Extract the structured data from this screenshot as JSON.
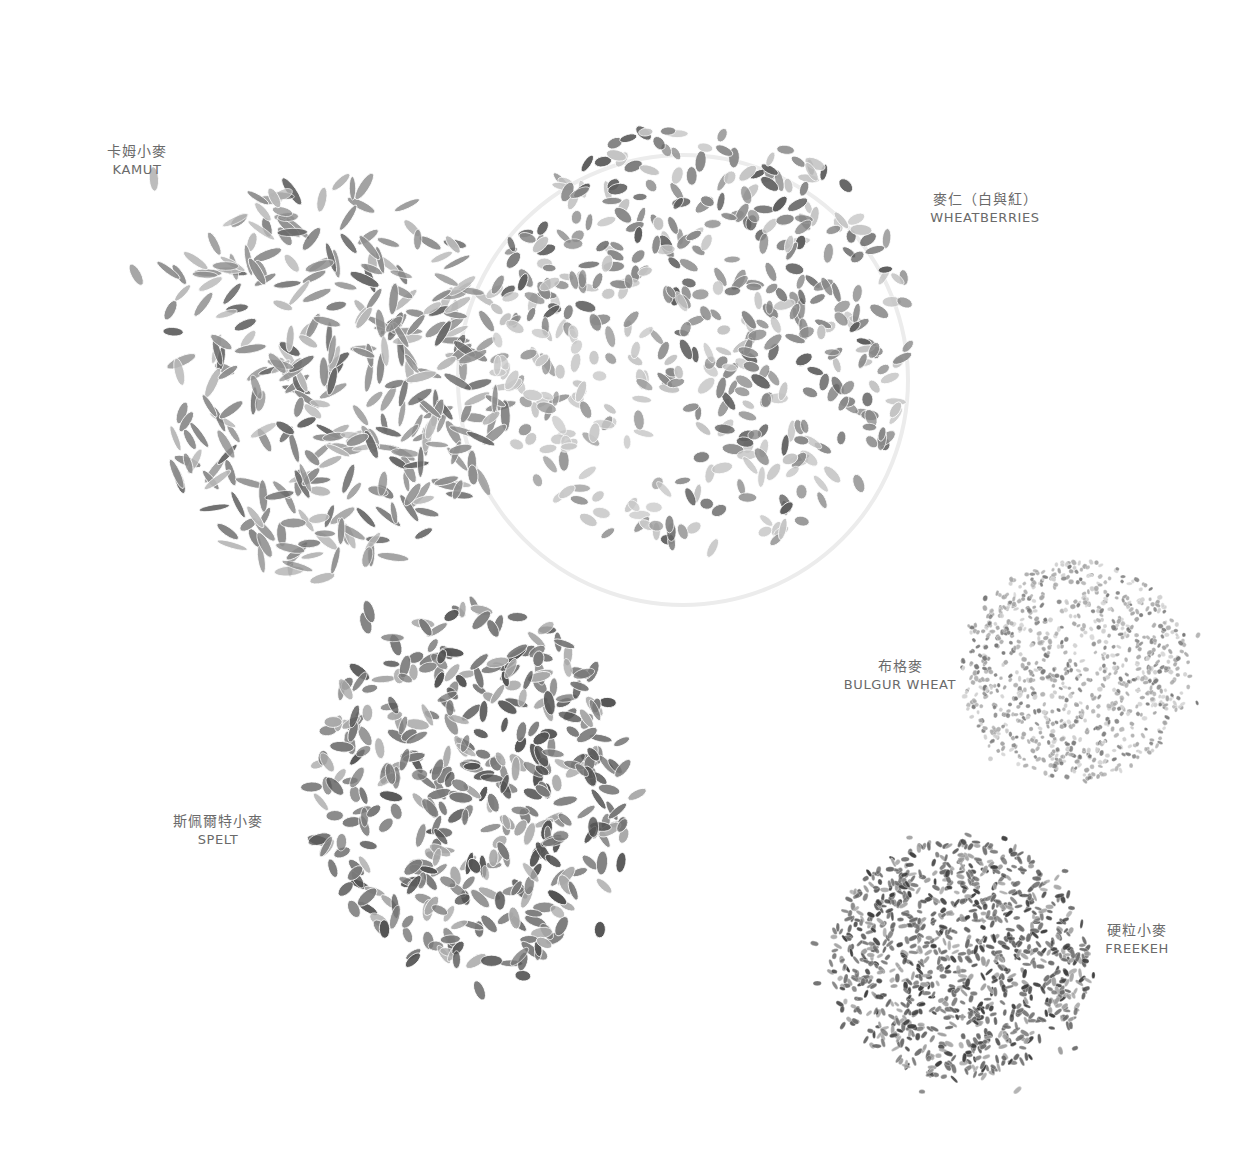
{
  "image": {
    "subject": "Overhead photo of wheat grain varieties on white background, grayscale",
    "background": "#ffffff"
  },
  "grains": [
    {
      "id": "kamut",
      "label_zh": "卡姆小麥",
      "label_en": "KAMUT",
      "pile": {
        "cx": 330,
        "cy": 380,
        "rx": 175,
        "ry": 200,
        "count": 360,
        "scatter": 70,
        "len": 26,
        "wid": 8,
        "tone": "#8f8f8f",
        "shade": "#6a6a6a",
        "light": "#b8b8b8"
      }
    },
    {
      "id": "wheatberries",
      "label_zh": "麥仁（白與紅）",
      "label_en": "WHEATBERRIES",
      "pile": {
        "cx": 700,
        "cy": 340,
        "rx": 215,
        "ry": 215,
        "count": 520,
        "scatter": 8,
        "len": 18,
        "wid": 9,
        "tone": "#8a8a8a",
        "shade": "#5f5f5f",
        "light": "#c4c4c4"
      }
    },
    {
      "id": "bulgur",
      "label_zh": "布格麥",
      "label_en": "BULGUR WHEAT",
      "pile": {
        "cx": 1075,
        "cy": 670,
        "rx": 115,
        "ry": 110,
        "count": 900,
        "scatter": 20,
        "len": 5,
        "wid": 4,
        "tone": "#a8a8a8",
        "shade": "#7a7a7a",
        "light": "#cfcfcf"
      }
    },
    {
      "id": "spelt",
      "label_zh": "斯佩爾特小麥",
      "label_en": "SPELT",
      "pile": {
        "cx": 470,
        "cy": 790,
        "rx": 160,
        "ry": 185,
        "count": 420,
        "scatter": 50,
        "len": 20,
        "wid": 9,
        "tone": "#7a7a7a",
        "shade": "#545454",
        "light": "#a9a9a9"
      }
    },
    {
      "id": "freekeh",
      "label_zh": "硬粒小麥",
      "label_en": "FREEKEH",
      "pile": {
        "cx": 960,
        "cy": 960,
        "rx": 130,
        "ry": 120,
        "count": 1000,
        "scatter": 25,
        "len": 8,
        "wid": 4,
        "tone": "#6c6c6c",
        "shade": "#3f3f3f",
        "light": "#a0a0a0"
      }
    }
  ],
  "labels": {
    "kamut": {
      "zh": "卡姆小麥",
      "en": "KAMUT"
    },
    "wheatberries": {
      "zh": "麥仁（白與紅）",
      "en": "WHEATBERRIES"
    },
    "bulgur": {
      "zh": "布格麥",
      "en": "BULGUR WHEAT"
    },
    "spelt": {
      "zh": "斯佩爾特小麥",
      "en": "SPELT"
    },
    "freekeh": {
      "zh": "硬粒小麥",
      "en": "FREEKEH"
    }
  },
  "bowl": {
    "cx": 683,
    "cy": 380,
    "r": 225,
    "stroke": "#ececec"
  }
}
